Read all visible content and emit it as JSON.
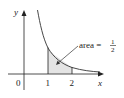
{
  "figure": {
    "y_axis_label": "y",
    "x_axis_label": "x",
    "origin_label": "0",
    "ticks": [
      "1",
      "2"
    ],
    "annotation": {
      "text": "area =",
      "fraction_numerator": "1",
      "fraction_denominator": "2"
    },
    "curve": "y = 1/x^2",
    "shaded_region": {
      "from": 1,
      "to": 2
    },
    "colors": {
      "axis": "#222222",
      "curve": "#333333",
      "shade": "#e4e4e4"
    }
  }
}
